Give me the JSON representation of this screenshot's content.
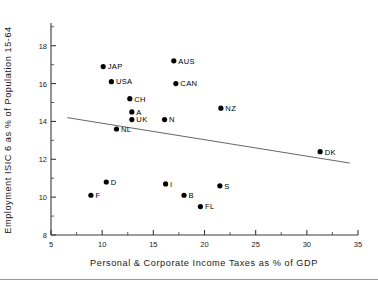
{
  "chart_data": {
    "type": "scatter",
    "title": "",
    "xlabel": "Personal & Corporate Income Taxes as % of GDP",
    "ylabel": "Employment ISIC 6 as % of Population 15-64",
    "xlim": [
      5,
      35
    ],
    "ylim": [
      8,
      19.2
    ],
    "xticks": [
      5,
      10,
      15,
      20,
      25,
      30,
      35
    ],
    "xtick_labels": [
      "5",
      "10",
      "15",
      "20",
      "25",
      "30",
      "35"
    ],
    "yticks": [
      8,
      10,
      12,
      14,
      16,
      18
    ],
    "ytick_labels": [
      "8",
      "10",
      "12",
      "14",
      "16",
      "18"
    ],
    "x_minor_ticks": [
      7.5,
      12.5,
      17.5,
      22.5,
      27.5,
      32.5
    ],
    "y_minor_ticks": [
      9,
      11,
      13,
      15,
      17,
      19
    ],
    "grid": false,
    "legend": "none",
    "marker_color": "#000000",
    "trend_color": "#555555",
    "points": [
      {
        "label": "JAP",
        "x": 10.1,
        "y": 16.9,
        "label_pos": "right"
      },
      {
        "label": "USA",
        "x": 10.9,
        "y": 16.1,
        "label_pos": "right"
      },
      {
        "label": "AUS",
        "x": 17.0,
        "y": 17.2,
        "label_pos": "right"
      },
      {
        "label": "CAN",
        "x": 17.2,
        "y": 16.0,
        "label_pos": "right"
      },
      {
        "label": "CH",
        "x": 12.7,
        "y": 15.2,
        "label_pos": "right"
      },
      {
        "label": "A",
        "x": 12.9,
        "y": 14.5,
        "label_pos": "right"
      },
      {
        "label": "UK",
        "x": 12.9,
        "y": 14.1,
        "label_pos": "right"
      },
      {
        "label": "NL",
        "x": 11.4,
        "y": 13.6,
        "label_pos": "right"
      },
      {
        "label": "N",
        "x": 16.1,
        "y": 14.1,
        "label_pos": "right"
      },
      {
        "label": "NZ",
        "x": 21.6,
        "y": 14.7,
        "label_pos": "right"
      },
      {
        "label": "DK",
        "x": 31.3,
        "y": 12.4,
        "label_pos": "right"
      },
      {
        "label": "D",
        "x": 10.4,
        "y": 10.8,
        "label_pos": "right"
      },
      {
        "label": "F",
        "x": 8.9,
        "y": 10.1,
        "label_pos": "right"
      },
      {
        "label": "I",
        "x": 16.2,
        "y": 10.7,
        "label_pos": "right"
      },
      {
        "label": "B",
        "x": 18.0,
        "y": 10.1,
        "label_pos": "right"
      },
      {
        "label": "FL",
        "x": 19.6,
        "y": 9.5,
        "label_pos": "right"
      },
      {
        "label": "S",
        "x": 21.5,
        "y": 10.6,
        "label_pos": "right"
      }
    ],
    "trend": {
      "x0": 6.6,
      "y0": 14.2,
      "x1": 34.2,
      "y1": 11.8
    }
  }
}
